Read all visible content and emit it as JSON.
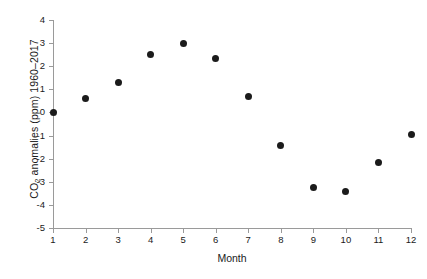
{
  "chart_data": {
    "type": "scatter",
    "title": "",
    "xlabel": "Month",
    "ylabel": "CO2 anomalies (ppm) 1960-2017",
    "ylabel_parts": {
      "before": "CO",
      "subscript": "2",
      "after": " anomalies (ppm) 1960–2017"
    },
    "x": [
      1,
      2,
      3,
      4,
      5,
      6,
      7,
      8,
      9,
      10,
      11,
      12
    ],
    "values": [
      0.0,
      0.6,
      1.3,
      2.5,
      3.0,
      2.35,
      0.7,
      -1.45,
      -3.25,
      -3.4,
      -2.15,
      -0.95
    ],
    "categories": [
      "1",
      "2",
      "3",
      "4",
      "5",
      "6",
      "7",
      "8",
      "9",
      "10",
      "11",
      "12"
    ],
    "xlim": [
      1,
      12
    ],
    "ylim": [
      -5,
      4
    ],
    "ytick_labels": [
      "4",
      "3",
      "2",
      "1",
      "0",
      "-1",
      "-2",
      "-3",
      "-4",
      "-5"
    ],
    "ytick_values": [
      4,
      3,
      2,
      1,
      0,
      -1,
      -2,
      -3,
      -4,
      -5
    ],
    "xtick_labels": [
      "1",
      "2",
      "3",
      "4",
      "5",
      "6",
      "7",
      "8",
      "9",
      "10",
      "11",
      "12"
    ],
    "grid": false,
    "legend": null,
    "marker": "filled-circle",
    "marker_color": "#1b1b1b",
    "axis_color": "#9a9a9a",
    "background_color": "#ffffff"
  }
}
